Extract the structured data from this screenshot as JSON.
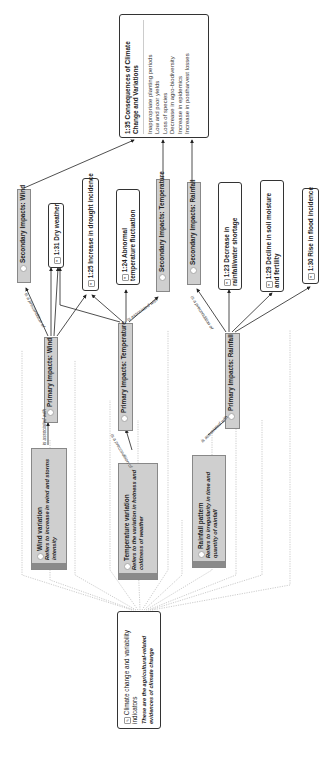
{
  "diagram": {
    "orientation": "rotated-90-ccw",
    "root": {
      "title": "Climate change and variability indicators",
      "description": "These are the agricultural-related evidences of climate change"
    },
    "consequences": {
      "title": "1:35 Consequences of Climate Change and Variations",
      "items": [
        "Inappropriate planting periods",
        "Low and poor yields",
        "Loss of species",
        "Decrease in agro-biodiversity",
        "Increase in epidemics",
        "Increase in postharvest losses"
      ]
    },
    "variations": [
      {
        "title": "Wind variation",
        "description": "Refers to increase in wind and storms intensity"
      },
      {
        "title": "Temperature variation",
        "description": "Refers to the variation in hotness and coldness of weather"
      },
      {
        "title": "Rainfall pattern",
        "description": "Refers to irregularity in time and quantity of rainfall"
      }
    ],
    "primary": [
      {
        "title": "Primary Impacts: Wind"
      },
      {
        "title": "Primary Impacts: Temperature"
      },
      {
        "title": "Primary Impacts: Rainfall"
      }
    ],
    "secondary": [
      {
        "title": "Secondary Impacts: Wind"
      },
      {
        "title": "Secondary Impacts: Temperature"
      },
      {
        "title": "Secondary Impacts: Rainfall"
      }
    ],
    "effects": [
      {
        "title": "1:31 Dry weather"
      },
      {
        "title": "1:25 Increase in drought incidence"
      },
      {
        "title": "1:24 Abnormal temperature fluctuation"
      },
      {
        "title": "1:23 Decrease in rainfall/water shortage"
      },
      {
        "title": "1:29 Decline in soil moisture and fertility"
      },
      {
        "title": "1:30 Rise in flood incidence"
      }
    ],
    "relations": {
      "associated_with": "is associated with",
      "precondition": "is a precondition of"
    }
  }
}
